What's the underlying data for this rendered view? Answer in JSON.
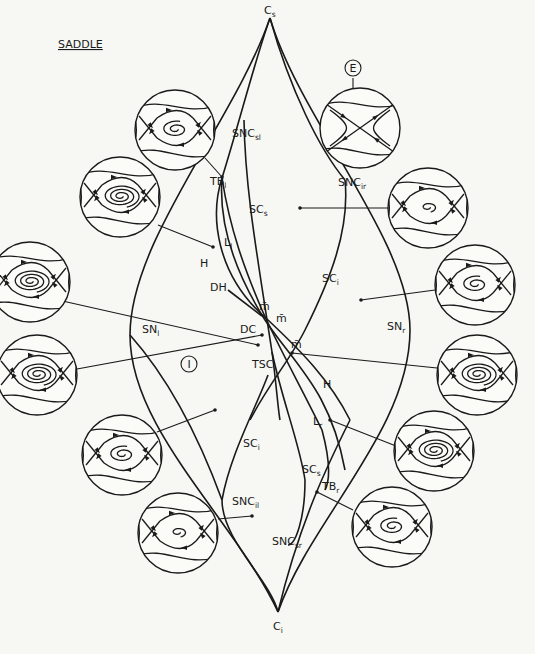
{
  "title": "SADDLE",
  "cusps": {
    "top": {
      "label": "C",
      "sub": "s",
      "x": 270,
      "y": 18
    },
    "bottom": {
      "label": "C",
      "sub": "i",
      "x": 278,
      "y": 612
    }
  },
  "curve_labels": [
    {
      "id": "SNl",
      "label": "SN",
      "sub": "l",
      "x": 142,
      "y": 333
    },
    {
      "id": "SNr",
      "label": "SN",
      "sub": "r",
      "x": 387,
      "y": 330
    },
    {
      "id": "SNCsl",
      "label": "SNC",
      "sub": "sl",
      "x": 232,
      "y": 137
    },
    {
      "id": "SNCir",
      "label": "SNC",
      "sub": "ir",
      "x": 338,
      "y": 186
    },
    {
      "id": "SNCil",
      "label": "SNC",
      "sub": "il",
      "x": 232,
      "y": 505
    },
    {
      "id": "SNCsr",
      "label": "SNC",
      "sub": "sr",
      "x": 272,
      "y": 545
    },
    {
      "id": "TBl",
      "label": "TB",
      "sub": "l",
      "x": 210,
      "y": 185
    },
    {
      "id": "TBr",
      "label": "TB",
      "sub": "r",
      "x": 322,
      "y": 490
    },
    {
      "id": "SCs_top",
      "label": "SC",
      "sub": "s",
      "x": 249,
      "y": 213
    },
    {
      "id": "SCi_right",
      "label": "SC",
      "sub": "i",
      "x": 322,
      "y": 282
    },
    {
      "id": "SCi_bottom",
      "label": "SC",
      "sub": "i",
      "x": 243,
      "y": 447
    },
    {
      "id": "SCs_bottom",
      "label": "SC",
      "sub": "s",
      "x": 302,
      "y": 473
    },
    {
      "id": "Ll",
      "label": "L",
      "sub": "l",
      "x": 224,
      "y": 246
    },
    {
      "id": "Lr",
      "label": "L",
      "sub": "r",
      "x": 313,
      "y": 425
    },
    {
      "id": "H_top",
      "label": "H",
      "sub": "",
      "x": 200,
      "y": 267
    },
    {
      "id": "H_bottom",
      "label": "H",
      "sub": "",
      "x": 323,
      "y": 388
    },
    {
      "id": "DH",
      "label": "DH",
      "sub": "",
      "x": 210,
      "y": 291
    },
    {
      "id": "DC",
      "label": "DC",
      "sub": "",
      "x": 240,
      "y": 333
    },
    {
      "id": "TSC",
      "label": "TSC",
      "sub": "",
      "x": 252,
      "y": 368
    },
    {
      "id": "mbar1",
      "label": "m̄",
      "sub": "",
      "x": 259,
      "y": 310
    },
    {
      "id": "mbar2",
      "label": "m̄",
      "sub": "",
      "x": 276,
      "y": 322
    },
    {
      "id": "mbar3",
      "label": "m̄",
      "sub": "",
      "x": 291,
      "y": 348
    }
  ],
  "region_markers": [
    {
      "id": "E",
      "label": "E",
      "x": 353,
      "y": 68
    },
    {
      "id": "I",
      "label": "I",
      "x": 189,
      "y": 364
    }
  ],
  "portraits": [
    {
      "id": "p1",
      "cx": 175,
      "cy": 130,
      "r": 40,
      "type": "spiral-small",
      "leader": [
        [
          205,
          158
        ],
        [
          222,
          177
        ]
      ]
    },
    {
      "id": "p2",
      "cx": 120,
      "cy": 197,
      "r": 40,
      "type": "spiral-big",
      "leader": [
        [
          158,
          225
        ],
        [
          213,
          247
        ]
      ]
    },
    {
      "id": "p3",
      "cx": 30,
      "cy": 282,
      "r": 40,
      "type": "spiral-big",
      "leader": [
        [
          58,
          300
        ],
        [
          258,
          345
        ]
      ]
    },
    {
      "id": "p4",
      "cx": 37,
      "cy": 375,
      "r": 40,
      "type": "spiral-big",
      "leader": [
        [
          77,
          369
        ],
        [
          262,
          335
        ]
      ]
    },
    {
      "id": "p5",
      "cx": 122,
      "cy": 455,
      "r": 40,
      "type": "spiral-small",
      "leader": [
        [
          157,
          432
        ],
        [
          215,
          410
        ]
      ]
    },
    {
      "id": "p6",
      "cx": 178,
      "cy": 533,
      "r": 40,
      "type": "spiral-tiny",
      "leader": [
        [
          218,
          519
        ],
        [
          252,
          516
        ]
      ]
    },
    {
      "id": "p7",
      "cx": 360,
      "cy": 128,
      "r": 40,
      "type": "saddle",
      "leader": [
        [
          353,
          90
        ],
        [
          353,
          78
        ]
      ]
    },
    {
      "id": "p8",
      "cx": 428,
      "cy": 208,
      "r": 40,
      "type": "spiral-tiny",
      "leader": [
        [
          388,
          208
        ],
        [
          300,
          208
        ]
      ]
    },
    {
      "id": "p9",
      "cx": 475,
      "cy": 285,
      "r": 40,
      "type": "spiral-small",
      "leader": [
        [
          435,
          290
        ],
        [
          361,
          300
        ]
      ]
    },
    {
      "id": "p10",
      "cx": 477,
      "cy": 375,
      "r": 40,
      "type": "spiral-big",
      "leader": [
        [
          437,
          368
        ],
        [
          292,
          353
        ]
      ]
    },
    {
      "id": "p11",
      "cx": 434,
      "cy": 451,
      "r": 40,
      "type": "spiral-big",
      "leader": [
        [
          396,
          446
        ],
        [
          330,
          420
        ]
      ]
    },
    {
      "id": "p12",
      "cx": 392,
      "cy": 527,
      "r": 40,
      "type": "spiral-small",
      "leader": [
        [
          353,
          510
        ],
        [
          317,
          492
        ]
      ]
    }
  ],
  "curves": {
    "SNl": "M270,18 C235,120 130,240 130,335 C130,430 235,520 278,612",
    "SNr": "M270,18 C300,120 410,240 410,330 C410,430 310,520 278,612",
    "main_diag_left": "M270,18 C255,60 240,120 222,178 C210,215 215,275 268,320 C300,350 330,380 350,420",
    "SCs_top": "M244,120 C245,190 258,260 272,352 C276,380 278,410 280,420",
    "SNCir_curve": "M345,180 C350,230 330,280 305,330 C290,360 268,385 250,420",
    "H_curve": "M222,178 C218,230 240,280 265,320 C295,365 330,390 345,470",
    "Ll_curve": "M222,178 C230,230 245,270 262,310 C280,350 300,385 322,430 C330,460 330,480 325,490",
    "SCi_bottom": "M268,375 C255,410 230,455 222,500 C222,540 270,580 278,612",
    "SCs_bottom": "M272,352 C282,400 300,445 305,480 C305,520 295,545 288,545",
    "SNCil_diag": "M222,500 C250,540 270,580 278,612",
    "lower_right_diag": "M350,420 C330,460 300,520 278,612"
  }
}
